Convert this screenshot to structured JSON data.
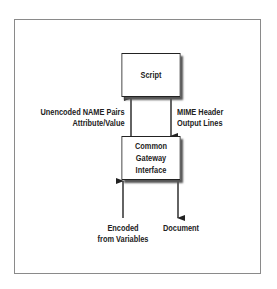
{
  "diagram": {
    "nodes": {
      "script": {
        "label": "Script"
      },
      "cgi": {
        "label_line1": "Common Gateway",
        "label_line2": "Interface"
      }
    },
    "edges": {
      "to_script": {
        "line1": "Unencoded NAME Pairs",
        "line2": "Attribute/Value",
        "from": "Common Gateway Interface",
        "to": "Script"
      },
      "from_script": {
        "line1": "MIME Header",
        "line2": "Output Lines",
        "from": "Script",
        "to": "Common Gateway Interface"
      },
      "input": {
        "line1": "Encoded",
        "line2": "from Variables",
        "to": "Common Gateway Interface"
      },
      "output": {
        "line1": "Document",
        "from": "Common Gateway Interface"
      }
    }
  }
}
